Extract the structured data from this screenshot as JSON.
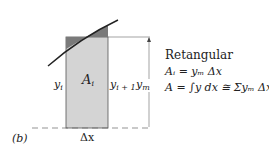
{
  "figure": {
    "panel_label": "(b)",
    "strip_area_label": "A",
    "strip_area_sub": "i",
    "left_height_label": "y",
    "left_height_sub": "i",
    "right_height_label": "y",
    "right_height_sub": "i + 1",
    "mean_height_label": "y",
    "mean_height_sub": "m",
    "width_label": "Δx"
  },
  "formulas": {
    "title": "Retangular",
    "line1": "Aᵢ = yₘ Δx",
    "line2": "A = ∫y dx ≅ Σyₘ Δx"
  },
  "colors": {
    "strip_fill": "#d4d4d4",
    "excess_fill": "#7a7a7a",
    "line": "#333333"
  }
}
